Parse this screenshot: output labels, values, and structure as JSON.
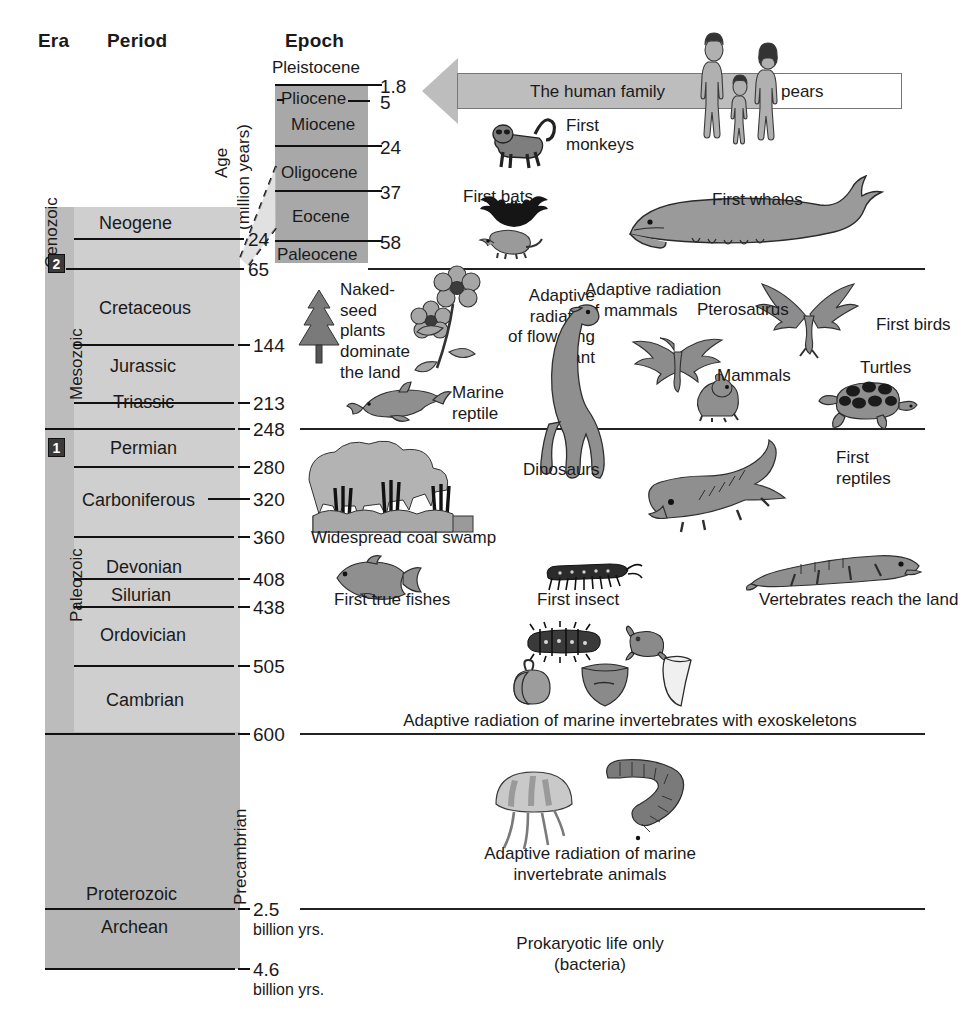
{
  "figure": {
    "title_columns": {
      "era": "Era",
      "period": "Period",
      "epoch": "Epoch"
    },
    "age_axis_label_line1": "Age",
    "age_axis_label_line2": "(million years)"
  },
  "eras": [
    {
      "name": "Cenozoic",
      "badge": null
    },
    {
      "name": "Mesozoic",
      "badge": "2"
    },
    {
      "name": "Paleozoic",
      "badge": "1"
    },
    {
      "name": "Precambrian",
      "badge": null
    }
  ],
  "era_badges": {
    "mesozoic": "2",
    "paleozoic": "1"
  },
  "periods": [
    {
      "name": "Neogene"
    },
    {
      "name": "Cretaceous"
    },
    {
      "name": "Jurassic"
    },
    {
      "name": "Triassic"
    },
    {
      "name": "Permian"
    },
    {
      "name": "Carboniferous"
    },
    {
      "name": "Devonian"
    },
    {
      "name": "Silurian"
    },
    {
      "name": "Ordovician"
    },
    {
      "name": "Cambrian"
    },
    {
      "name": "Proterozoic"
    },
    {
      "name": "Archean"
    }
  ],
  "epochs": [
    {
      "name": "Pleistocene"
    },
    {
      "name": "Pliocene"
    },
    {
      "name": "Miocene"
    },
    {
      "name": "Oligocene"
    },
    {
      "name": "Eocene"
    },
    {
      "name": "Paleocene"
    }
  ],
  "epoch_ages": [
    "1.8",
    "5",
    "24",
    "37",
    "58"
  ],
  "period_ages": [
    "24",
    "65",
    "144",
    "213",
    "248",
    "280",
    "320",
    "360",
    "408",
    "438",
    "505",
    "600"
  ],
  "deep_ages": [
    {
      "value": "2.5",
      "unit": "billion yrs."
    },
    {
      "value": "4.6",
      "unit": "billion yrs."
    }
  ],
  "banner": {
    "text_left": "The human family",
    "text_right": "pears"
  },
  "captions": {
    "first_monkeys": "First\nmonkeys",
    "first_bats": "First bats",
    "first_whales": "First whales",
    "naked_seed": "Naked-\nseed\nplants\ndominate\nthe land",
    "adaptive_flowering": "Adaptive\nradiation\nof flowering\nplant",
    "adaptive_mammals": "Adaptive radiation\nof mammals",
    "pterosaurus": "Pterosaurus",
    "first_birds": "First birds",
    "mammals": "Mammals",
    "turtles": "Turtles",
    "marine_reptile": "Marine\nreptile",
    "dinosaurs": "Dinosaurs",
    "first_reptiles": "First\nreptiles",
    "coal_swamp": "Widespread coal swamp",
    "first_true_fishes": "First true fishes",
    "first_insect": "First insect",
    "vertebrates_land": "Vertebrates reach the land",
    "exoskeletons": "Adaptive radiation of marine invertebrates with exoskeletons",
    "marine_invertebrates": "Adaptive radiation of marine\ninvertebrate animals",
    "prokaryotic": "Prokaryotic life only\n(bacteria)"
  },
  "colors": {
    "era_block": "#bcbcbc",
    "period_block": "#cfcfcf",
    "precambrian_block": "#b5b5b5",
    "epoch_block": "#a8a8a8",
    "banner_fill": "#bdbdbd",
    "rule": "#111111",
    "badge": "#3a3a3a"
  }
}
